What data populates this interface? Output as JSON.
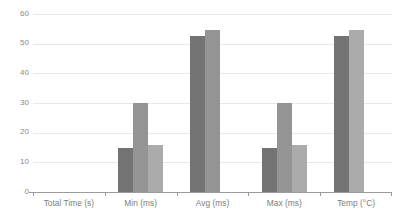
{
  "chart_data": {
    "type": "bar",
    "title": "",
    "subtitle": "",
    "xlabel": "",
    "ylabel": "",
    "ylim": [
      0,
      60
    ],
    "yticks": [
      0,
      10,
      20,
      30,
      40,
      50,
      60
    ],
    "grid": true,
    "legend": "none",
    "categories": [
      "Total Time (s)",
      "Min (ms)",
      "Avg (ms)",
      "Max (ms)",
      "Temp (°C)"
    ],
    "series": [
      {
        "name": "Series 1",
        "color": "#737373",
        "values": [
          5,
          0,
          0,
          15,
          52.5
        ]
      },
      {
        "name": "Series 2",
        "color": "#949494",
        "values": [
          5,
          0,
          0,
          30,
          54.5
        ]
      },
      {
        "name": "Series 3",
        "color": "#ababab",
        "values": [
          3.5,
          0,
          0,
          16,
          0
        ]
      }
    ]
  },
  "axis": {
    "y_tick_labels": [
      "60",
      "50",
      "40",
      "30",
      "20",
      "10",
      "0"
    ],
    "x_tick_labels": [
      "Total Time (s)",
      "Min (ms)",
      "Avg (ms)",
      "Max (ms)",
      "Temp (°C)"
    ]
  },
  "colors": {
    "series_1": "#737373",
    "series_2": "#949494",
    "series_3": "#ababab",
    "gridline": "#e9e9e9",
    "axis_line": "#9a9a9a",
    "tick_text": "#8a8a8a",
    "background": "#ffffff"
  }
}
